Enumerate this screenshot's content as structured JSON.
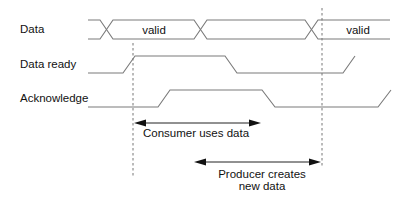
{
  "signals": [
    {
      "name": "data",
      "label": "Data"
    },
    {
      "name": "data-ready",
      "label": "Data ready"
    },
    {
      "name": "acknowledge",
      "label": "Acknowledge"
    }
  ],
  "data_bus": {
    "segments": [
      {
        "label": "valid"
      },
      {
        "label": ""
      },
      {
        "label": "valid"
      }
    ]
  },
  "annotations": {
    "consumer": {
      "label": "Consumer uses data"
    },
    "producer": {
      "line1": "Producer creates",
      "line2": "new data"
    }
  },
  "colors": {
    "waveform": "#7a7a7a",
    "arrow": "#111111",
    "text": "#111111",
    "background": "#ffffff"
  }
}
